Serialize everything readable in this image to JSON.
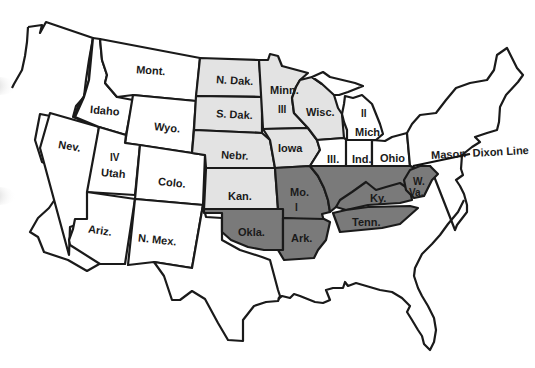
{
  "map": {
    "title": "",
    "colors": {
      "region_white": "#ffffff",
      "region_light": "#e3e3e3",
      "region_dark": "#7a7a7a",
      "outline": "#1a1a1a"
    },
    "states": {
      "mont": "Mont.",
      "idaho": "Idaho",
      "wyo": "Wyo.",
      "nev": "Nev.",
      "utah": "Utah",
      "utah_roman": "IV",
      "colo": "Colo.",
      "ariz": "Ariz.",
      "nmex": "N. Mex.",
      "ndak": "N. Dak.",
      "sdak": "S. Dak.",
      "nebr": "Nebr.",
      "kan": "Kan.",
      "minn": "Minn.",
      "minn_roman": "III",
      "iowa": "Iowa",
      "wisc": "Wisc.",
      "mich": "Mich.",
      "mich_roman": "II",
      "ill": "Ill.",
      "ind": "Ind.",
      "ohio": "Ohio",
      "mo": "Mo.",
      "mo_roman": "I",
      "okla": "Okla.",
      "ark": "Ark.",
      "ky": "Ky.",
      "tenn": "Tenn.",
      "wva_line1": "W.",
      "wva_line2": "Va."
    },
    "annotations": {
      "mason_dixon": "Mason- Dixon Line"
    },
    "legend": {
      "white": "Unshaded states",
      "light": "Light gray shaded states",
      "dark": "Dark gray shaded states"
    }
  }
}
